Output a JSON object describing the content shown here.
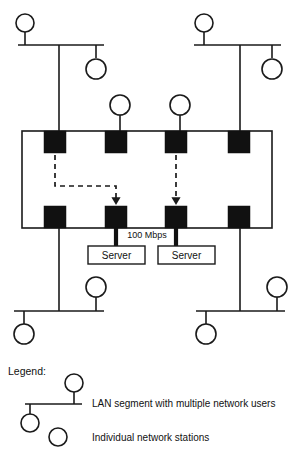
{
  "diagram": {
    "colors": {
      "line": "#1a1a1a",
      "node_fill": "#111111",
      "background": "#ffffff",
      "station_fill": "#ffffff"
    },
    "backbone": {
      "top_nodes": 4,
      "bottom_nodes": 4,
      "dashed_links": 2
    },
    "labels": {
      "speed": "100 Mbps",
      "server_left": "Server",
      "server_right": "Server"
    },
    "legend": {
      "title": "Legend:",
      "items": [
        {
          "text": "LAN segment with multiple network users"
        },
        {
          "text": "Individual network stations"
        }
      ]
    }
  }
}
